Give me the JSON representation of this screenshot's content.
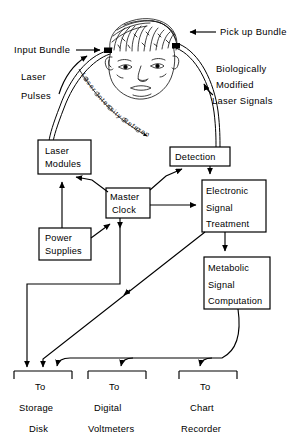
{
  "figure": {
    "type": "schematic-block-diagram"
  },
  "annotations": {
    "input_bundle": "Input Bundle",
    "pickup_bundle": "Pick up Bundle",
    "laser_pulses_l1": "Laser",
    "laser_pulses_l2": "Pulses",
    "bio_modified_l1": "Biologically",
    "bio_modified_l2": "Modified",
    "bio_modified_l3": "Laser Signals",
    "laser_intensity_reference": "Laser Intensity Reference"
  },
  "blocks": [
    {
      "id": "laser-modules",
      "lines": [
        "Laser",
        "Modules"
      ]
    },
    {
      "id": "power-supplies",
      "lines": [
        "Power",
        "Supplies"
      ]
    },
    {
      "id": "master-clock",
      "lines": [
        "Master",
        "Clock"
      ]
    },
    {
      "id": "detection",
      "lines": [
        "Detection"
      ]
    },
    {
      "id": "electronic-signal-treatment",
      "lines": [
        "Electronic",
        "Signal",
        "Treatment"
      ]
    },
    {
      "id": "metabolic-signal-computation",
      "lines": [
        "Metabolic",
        "Signal",
        "Computation"
      ]
    }
  ],
  "outputs": [
    {
      "id": "storage-disk",
      "lines": [
        "To",
        "Storage",
        "Disk"
      ]
    },
    {
      "id": "digital-voltmeters",
      "lines": [
        "To",
        "Digital",
        "Voltmeters"
      ]
    },
    {
      "id": "chart-recorder",
      "lines": [
        "To",
        "Chart",
        "Recorder"
      ]
    }
  ],
  "colors": {
    "ink": "#000000",
    "paper": "#ffffff"
  }
}
